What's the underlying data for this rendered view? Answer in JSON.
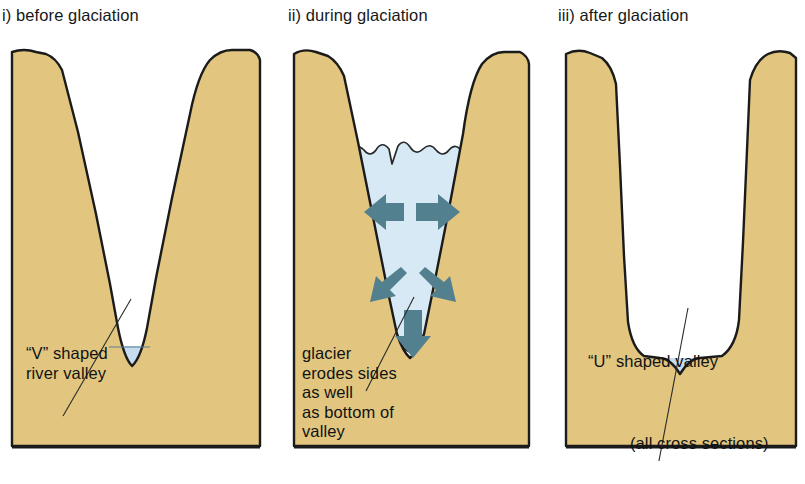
{
  "figure": {
    "type": "diagram",
    "note": "all cross sections"
  },
  "colors": {
    "rock": "#e2c67f",
    "rock_edge": "#1b1b1b",
    "ice": "#d6e9f5",
    "ice_edge": "#26282b",
    "water": "#c7dced",
    "arrow": "#53808f",
    "background": "#ffffff",
    "text": "#111214"
  },
  "panels": [
    {
      "id": "before",
      "title": "i) before glaciation",
      "caption": "“V” shaped\nriver valley",
      "valley_shape": "V",
      "has_glacier": false,
      "has_river": true,
      "arrows": []
    },
    {
      "id": "during",
      "title": "ii) during glaciation",
      "caption": "glacier\nerodes sides\nas well\nas bottom of\nvalley",
      "valley_shape": "V",
      "has_glacier": true,
      "has_river": false,
      "arrows": [
        {
          "name": "arrow-left",
          "direction": "left"
        },
        {
          "name": "arrow-right",
          "direction": "right"
        },
        {
          "name": "arrow-down-left",
          "direction": "down-left"
        },
        {
          "name": "arrow-down-right",
          "direction": "down-right"
        },
        {
          "name": "arrow-down",
          "direction": "down"
        }
      ]
    },
    {
      "id": "after",
      "title": "iii) after glaciation",
      "caption": "“U” shaped valley",
      "note": "(all cross sections)",
      "valley_shape": "U",
      "has_glacier": false,
      "has_river": true,
      "arrows": []
    }
  ]
}
